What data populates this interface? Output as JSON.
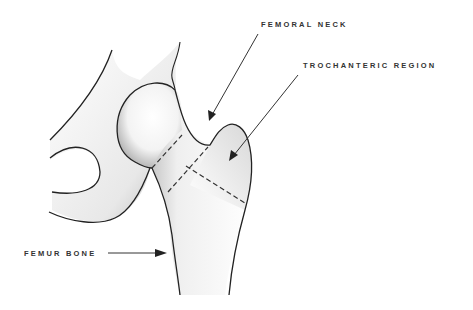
{
  "diagram": {
    "type": "anatomical illustration",
    "labels": {
      "femoral_neck": "FEMORAL NECK",
      "trochanteric_region": "TROCHANTERIC REGION",
      "femur_bone": "FEMUR BONE"
    },
    "colors": {
      "outline": "#222222",
      "shading": "#9a9a9a",
      "label_text": "#333333",
      "dashed_line": "#333333",
      "background": "#ffffff"
    }
  }
}
